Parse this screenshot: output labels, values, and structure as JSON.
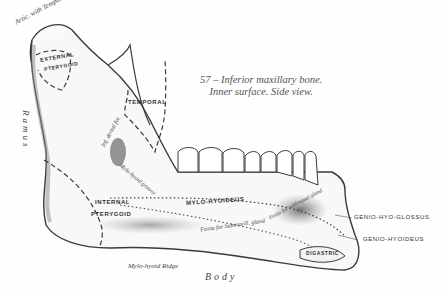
{
  "figure": {
    "caption_line1": "57 – Inferior maxillary bone.",
    "caption_line2": "Inner surface. Side view.",
    "colors": {
      "ink": "#3a3a3a",
      "shade": "#8a8a8a",
      "paper": "#fefefe"
    }
  },
  "labels": {
    "artic_temporal": "Artic. with Temporal",
    "external_pterygoid_1": "EXTERNAL",
    "external_pterygoid_2": "PTERYGOID",
    "temporal": "TEMPORAL",
    "ramus": "Ramus",
    "inferior_dental_foramen": "Inf. dental for.",
    "mylo_hyoid_groove": "Mylo-hyoid groove",
    "internal_pterygoid_1": "INTERNAL",
    "internal_pterygoid_2": "PTERYGOID",
    "mylo_hyoideus": "MYLO-HYOIDEUS",
    "fossa_sublingual": "Fossa for sublingual gland",
    "fossa_submaxillary": "Fossa for Submaxill. gland",
    "mylo_hyoid_ridge": "Mylo-hyoid Ridge",
    "body": "Body",
    "genio_hyo_glossus": "GENIO-HYO-GLOSSUS",
    "genio_hyoideus": "GENIO-HYOIDEUS",
    "digastric": "DIGASTRIC",
    "genial_tubercles": "genial tub."
  }
}
